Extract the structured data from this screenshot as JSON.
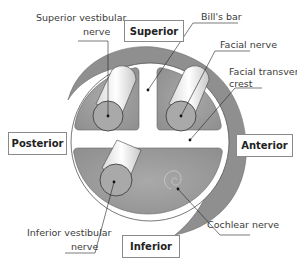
{
  "orientation_boxes": {
    "superior": "Superior",
    "posterior": "Posterior",
    "anterior": "Anterior",
    "inferior": "Inferior"
  },
  "labels": {
    "superior_vestibular_nerve_1": "Superior vestibular",
    "superior_vestibular_nerve_2": "nerve",
    "bills_bar": "Bill's bar",
    "facial_nerve": "Facial nerve",
    "facial_transverse_crest_1": "Facial transverse",
    "facial_transverse_crest_2": "crest",
    "cochlear_nerve": "Cochlear nerve",
    "inferior_vestibular_nerve_1": "Inferior vestibular",
    "inferior_vestibular_nerve_2": "nerve"
  },
  "colors": {
    "outer_ring": "#8c8c8c",
    "quadrant_fill": "#9a9a9a",
    "nerve_end": "#a8a8a8",
    "leader_line": "#222222"
  }
}
